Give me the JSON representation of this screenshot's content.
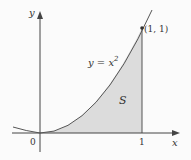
{
  "diagram": {
    "axes": {
      "x_label": "x",
      "y_label": "y"
    },
    "ticks": {
      "origin": "0",
      "x_one": "1"
    },
    "curve_label": "y = x",
    "curve_exponent": "2",
    "point_label": "(1, 1)",
    "region_label": "S",
    "colors": {
      "region_fill": "#dcdcdc",
      "curve": "#555555",
      "axes": "#444444"
    }
  }
}
